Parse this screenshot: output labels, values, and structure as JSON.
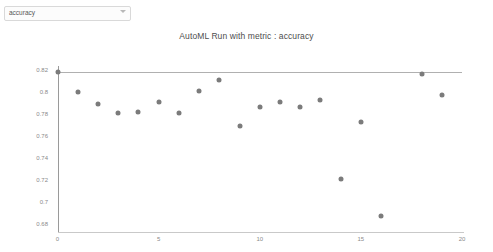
{
  "controls": {
    "metric_select": {
      "value": "accuracy",
      "icon": "chevron-down-icon",
      "options": [
        "accuracy"
      ]
    }
  },
  "chart": {
    "title": "AutoML Run with metric : accuracy"
  },
  "chart_data": {
    "type": "scatter",
    "title": "AutoML Run with metric : accuracy",
    "xlabel": "",
    "ylabel": "",
    "xlim": [
      0,
      20
    ],
    "ylim": [
      0.68,
      0.826
    ],
    "grid": false,
    "legend": null,
    "xticks": [
      0,
      5,
      10,
      15,
      20
    ],
    "xtick_labels": [
      "0",
      "5",
      "10",
      "15",
      "20"
    ],
    "yticks": [
      0.68,
      0.7,
      0.72,
      0.74,
      0.76,
      0.78,
      0.8,
      0.82
    ],
    "ytick_labels": [
      "0.68",
      "0.7",
      "0.72",
      "0.74",
      "0.76",
      "0.78",
      "0.8",
      "0.82"
    ],
    "series": [
      {
        "name": "accuracy",
        "color": "#7b7b7b",
        "x": [
          0,
          1,
          2,
          3,
          4,
          5,
          6,
          7,
          8,
          9,
          10,
          11,
          12,
          13,
          14,
          15,
          16,
          18,
          19
        ],
        "y": [
          0.818,
          0.8,
          0.789,
          0.781,
          0.782,
          0.791,
          0.781,
          0.801,
          0.811,
          0.769,
          0.786,
          0.791,
          0.786,
          0.793,
          0.721,
          0.773,
          0.687,
          0.8164,
          0.797
        ]
      }
    ],
    "annotations": [
      {
        "type": "hline",
        "name": "best-metric-line",
        "y": 0.8182,
        "x_start": 0,
        "x_end": 20,
        "color": "#b0b0b0"
      }
    ]
  }
}
